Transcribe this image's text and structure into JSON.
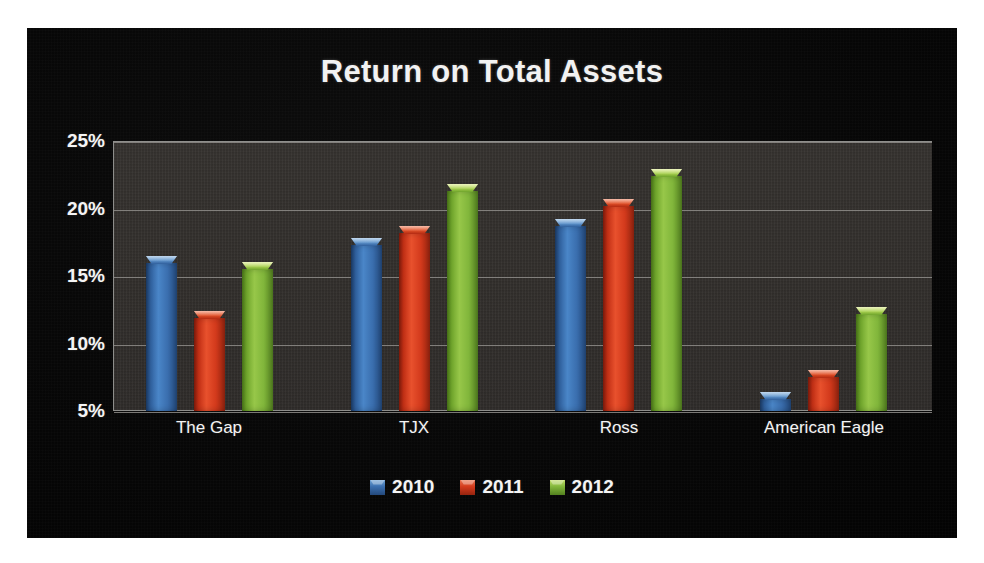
{
  "chart_data": {
    "type": "bar",
    "title": "Return on Total Assets",
    "xlabel": "",
    "ylabel": "",
    "categories": [
      "The Gap",
      "TJX",
      "Ross",
      "American Eagle"
    ],
    "series": [
      {
        "name": "2010",
        "color": "#3a6eae",
        "values": [
          16.5,
          17.8,
          19.2,
          6.4
        ]
      },
      {
        "name": "2011",
        "color": "#d33a1c",
        "values": [
          12.4,
          18.7,
          20.7,
          8.0
        ]
      },
      {
        "name": "2012",
        "color": "#81b63b",
        "values": [
          16.0,
          21.8,
          22.9,
          12.7
        ]
      }
    ],
    "ylim": [
      5,
      25
    ],
    "ytick_values": [
      5,
      10,
      15,
      20,
      25
    ],
    "ytick_labels": [
      "5%",
      "10%",
      "15%",
      "20%",
      "25%"
    ],
    "grid": true,
    "legend_position": "bottom",
    "background_color": "#0a0a0a",
    "plot_background_color": "#322f2c",
    "text_color": "#f4f4f4"
  }
}
